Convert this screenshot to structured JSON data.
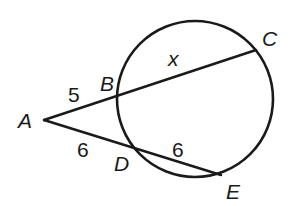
{
  "diagram": {
    "type": "secant-secant",
    "circle": {
      "cx": 195,
      "cy": 99,
      "r": 78
    },
    "points": {
      "A": {
        "label": "A",
        "x": 44,
        "y": 120
      },
      "B": {
        "label": "B",
        "x": 119,
        "y": 96
      },
      "C": {
        "label": "C",
        "x": 256,
        "y": 50
      },
      "D": {
        "label": "D",
        "x": 138,
        "y": 149
      },
      "E": {
        "label": "E",
        "x": 221,
        "y": 175
      }
    },
    "segments": {
      "AB": {
        "label": "5"
      },
      "BC": {
        "label": "x"
      },
      "AD": {
        "label": "6"
      },
      "DE": {
        "label": "6"
      }
    }
  }
}
